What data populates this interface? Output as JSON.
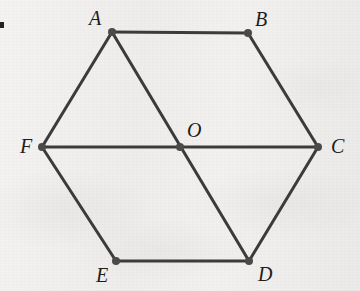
{
  "figure": {
    "kind": "geometry-diagram",
    "canvas": {
      "width": 360,
      "height": 291
    },
    "colors": {
      "background": "#f1f0ee",
      "stroke": "#3b3b3b",
      "vertex_dot": "#4a4a4a",
      "label_text": "#1d1d1d"
    },
    "style": {
      "line_width_px": 3,
      "vertex_radius_px": 4,
      "label_font_size_px": 20,
      "label_font_style": "italic serif"
    },
    "points": [
      {
        "id": "A",
        "label": "A",
        "x": 112,
        "y": 32,
        "label_x": 89,
        "label_y": 8,
        "label_anchor": "above-left"
      },
      {
        "id": "B",
        "label": "B",
        "x": 248,
        "y": 33,
        "label_x": 255,
        "label_y": 9,
        "label_anchor": "above-right"
      },
      {
        "id": "C",
        "label": "C",
        "x": 318,
        "y": 147,
        "label_x": 331,
        "label_y": 136,
        "label_anchor": "right"
      },
      {
        "id": "D",
        "label": "D",
        "x": 249,
        "y": 261,
        "label_x": 258,
        "label_y": 264,
        "label_anchor": "below-right"
      },
      {
        "id": "E",
        "label": "E",
        "x": 116,
        "y": 261,
        "label_x": 96,
        "label_y": 265,
        "label_anchor": "below-left"
      },
      {
        "id": "F",
        "label": "F",
        "x": 42,
        "y": 147,
        "label_x": 20,
        "label_y": 136,
        "label_anchor": "left"
      },
      {
        "id": "O",
        "label": "O",
        "x": 180,
        "y": 147,
        "label_x": 187,
        "label_y": 120,
        "label_anchor": "above-right"
      }
    ],
    "segments": [
      {
        "id": "AB",
        "from": "A",
        "to": "B",
        "role": "hexagon-side"
      },
      {
        "id": "BC",
        "from": "B",
        "to": "C",
        "role": "hexagon-side"
      },
      {
        "id": "CD",
        "from": "C",
        "to": "D",
        "role": "hexagon-side"
      },
      {
        "id": "DE",
        "from": "D",
        "to": "E",
        "role": "hexagon-side"
      },
      {
        "id": "EF",
        "from": "E",
        "to": "F",
        "role": "hexagon-side"
      },
      {
        "id": "FA",
        "from": "F",
        "to": "A",
        "role": "hexagon-side"
      },
      {
        "id": "AD",
        "from": "A",
        "to": "D",
        "role": "diagonal-through-center"
      },
      {
        "id": "FC",
        "from": "F",
        "to": "C",
        "role": "diagonal-through-center"
      }
    ]
  },
  "artifacts": {
    "edge_mark": {
      "present": true,
      "note": "clipped black glyph fragment at left edge"
    }
  }
}
